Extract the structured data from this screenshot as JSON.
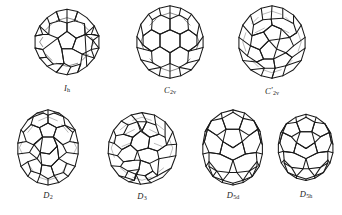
{
  "figure": {
    "background_color": "#ffffff",
    "line_color": "#1a1a1a",
    "structure_count": 7,
    "rows": [
      {
        "row_index": 1,
        "items": [
          {
            "id": "structure-ih",
            "label_main": "I",
            "label_sub": "h",
            "label_prime": "",
            "label_text": "Ih",
            "shape": "sphere",
            "cage": "c60-icosahedral"
          },
          {
            "id": "structure-c2v",
            "label_main": "C",
            "label_sub": "2v",
            "label_prime": "",
            "label_text": "C2v",
            "shape": "sphere",
            "cage": "c70-c2v-a"
          },
          {
            "id": "structure-c2v-prime",
            "label_main": "C",
            "label_sub": "2v",
            "label_prime": "′",
            "label_text": "C'2v",
            "shape": "sphere",
            "cage": "c70-c2v-b"
          }
        ]
      },
      {
        "row_index": 2,
        "items": [
          {
            "id": "structure-d2",
            "label_main": "D",
            "label_sub": "2",
            "label_prime": "",
            "label_text": "D2",
            "shape": "prolate",
            "cage": "c70-d2"
          },
          {
            "id": "structure-d3",
            "label_main": "D",
            "label_sub": "3",
            "label_prime": "",
            "label_text": "D3",
            "shape": "sphere",
            "cage": "c70-d3"
          },
          {
            "id": "structure-d5d",
            "label_main": "D",
            "label_sub": "5d",
            "label_prime": "",
            "label_text": "D5d",
            "shape": "prolate",
            "cage": "c70-d5d"
          },
          {
            "id": "structure-d5h",
            "label_main": "D",
            "label_sub": "5h",
            "label_prime": "",
            "label_text": "D5h",
            "shape": "prolate",
            "cage": "c70-d5h"
          }
        ]
      }
    ]
  }
}
